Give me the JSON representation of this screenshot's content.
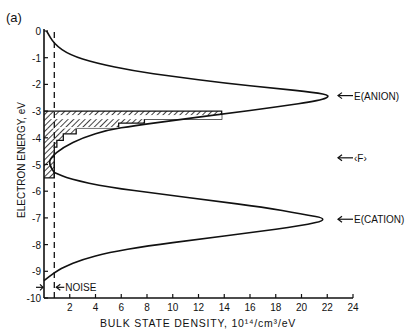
{
  "chart_data": {
    "type": "line",
    "panel_label": "(a)",
    "title": "",
    "xlabel": "BULK STATE DENSITY, 10¹⁴/cm³/eV",
    "ylabel": "ELECTRON ENERGY, eV",
    "xlim": [
      0,
      24
    ],
    "ylim": [
      -10,
      0
    ],
    "x_ticks": [
      "2",
      "4",
      "6",
      "8",
      "10",
      "12",
      "14",
      "16",
      "18",
      "20",
      "22",
      "24"
    ],
    "y_ticks": [
      "0",
      "-1",
      "-2",
      "-3",
      "-4",
      "-5",
      "-6",
      "-7",
      "-8",
      "-9",
      "-10"
    ],
    "grid": false,
    "series": [
      {
        "name": "Anion band density",
        "style": "solid",
        "points": [
          [
            0.2,
            0
          ],
          [
            0.8,
            -0.5
          ],
          [
            2,
            -0.9
          ],
          [
            4,
            -1.2
          ],
          [
            7,
            -1.5
          ],
          [
            10,
            -1.7
          ],
          [
            14,
            -1.95
          ],
          [
            18,
            -2.15
          ],
          [
            21,
            -2.3
          ],
          [
            22.3,
            -2.42
          ],
          [
            21.5,
            -2.6
          ],
          [
            18,
            -2.85
          ],
          [
            14,
            -3.1
          ],
          [
            10,
            -3.35
          ],
          [
            7,
            -3.55
          ],
          [
            5,
            -3.7
          ],
          [
            3,
            -4.0
          ],
          [
            1.5,
            -4.35
          ],
          [
            0.5,
            -4.75
          ],
          [
            0.4,
            -5.0
          ],
          [
            0.8,
            -5.3
          ]
        ]
      },
      {
        "name": "Cation band density",
        "style": "solid",
        "points": [
          [
            0.8,
            -5.3
          ],
          [
            2,
            -5.55
          ],
          [
            5,
            -5.85
          ],
          [
            9,
            -6.1
          ],
          [
            13,
            -6.35
          ],
          [
            17,
            -6.6
          ],
          [
            20,
            -6.85
          ],
          [
            22.2,
            -7.05
          ],
          [
            20,
            -7.3
          ],
          [
            16,
            -7.55
          ],
          [
            12,
            -7.8
          ],
          [
            8,
            -8.05
          ],
          [
            5,
            -8.3
          ],
          [
            3,
            -8.55
          ],
          [
            1.5,
            -8.85
          ],
          [
            0.8,
            -9.05
          ],
          [
            0,
            -9.35
          ]
        ]
      },
      {
        "name": "Measured histogram (hatched)",
        "style": "step",
        "bins": [
          {
            "e_top": -3.0,
            "e_bottom": -3.3,
            "density": 13.8
          },
          {
            "e_top": -3.3,
            "e_bottom": -3.45,
            "density": 7.8
          },
          {
            "e_top": -3.45,
            "e_bottom": -3.65,
            "density": 5.8
          },
          {
            "e_top": -3.65,
            "e_bottom": -3.85,
            "density": 2.5
          },
          {
            "e_top": -3.85,
            "e_bottom": -4.1,
            "density": 1.5
          },
          {
            "e_top": -4.1,
            "e_bottom": -4.35,
            "density": 1.0
          },
          {
            "e_top": -4.35,
            "e_bottom": -5.5,
            "density": 0.8
          }
        ]
      },
      {
        "name": "Noise level",
        "style": "dashed",
        "x": 0.8
      }
    ],
    "annotations": [
      {
        "text": "E(ANION)",
        "y": -2.42,
        "arrow": "left"
      },
      {
        "text": "‹F›",
        "y": -4.75,
        "arrow": "left"
      },
      {
        "text": "E(CATION)",
        "y": -7.05,
        "arrow": "left"
      },
      {
        "text": "NOISE",
        "y": -9.6,
        "arrow": "left"
      }
    ]
  }
}
